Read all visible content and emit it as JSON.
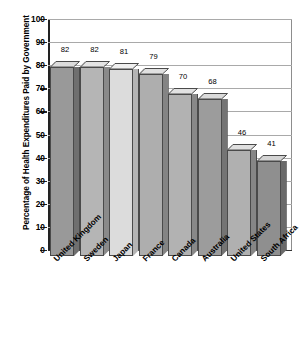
{
  "chart_data": {
    "type": "bar",
    "title": "",
    "subtitle": "",
    "xlabel": "",
    "ylabel": "Percentage of Health Expenditures Paid by Government",
    "ylim": [
      0,
      100
    ],
    "ytick_step": 10,
    "yticks": [
      "100",
      "90",
      "80",
      "70",
      "60",
      "50",
      "40",
      "30",
      "20",
      "10",
      "0"
    ],
    "grid": true,
    "legend": "none",
    "style": "3d-bar",
    "categories": [
      "United Kingdom",
      "Sweden",
      "Japan",
      "France",
      "Canada",
      "Australia",
      "United States",
      "South Africa"
    ],
    "values": [
      82,
      82,
      81,
      79,
      70,
      68,
      46,
      41
    ],
    "value_labels": [
      "82",
      "82",
      "81",
      "79",
      "70",
      "68",
      "46",
      "41"
    ],
    "bar_colors": [
      "#999999",
      "#b5b5b5",
      "#dcdcdc",
      "#aeaeae",
      "#b2b2b2",
      "#9c9c9c",
      "#b0b0b0",
      "#8f8f8f"
    ],
    "bar_top_colors": [
      "#dcdcdc",
      "#e4e4e4",
      "#f0f0f0",
      "#e0e0e0",
      "#e2e2e2",
      "#dadada",
      "#e0e0e0",
      "#d4d4d4"
    ],
    "bar_side_colors": [
      "#6f6f6f",
      "#8a8a8a",
      "#b4b4b4",
      "#848484",
      "#888888",
      "#747474",
      "#868686",
      "#6a6a6a"
    ]
  },
  "axes": {
    "gridline_color": "#a9a9a9",
    "spine_color": "#222222",
    "frame_color": "#8d8d8d"
  }
}
